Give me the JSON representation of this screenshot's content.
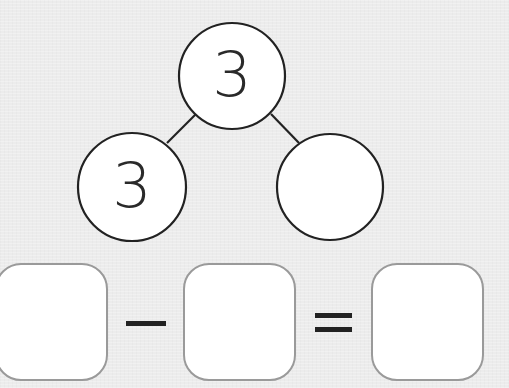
{
  "number_bond": {
    "whole": "3",
    "part_left": "3",
    "part_right": ""
  },
  "equation": {
    "box1": "",
    "operator1": "−",
    "box2": "",
    "operator2": "=",
    "box3": ""
  },
  "colors": {
    "background": "#ececec",
    "stroke": "#222222",
    "box_border": "#9a9a9a"
  }
}
